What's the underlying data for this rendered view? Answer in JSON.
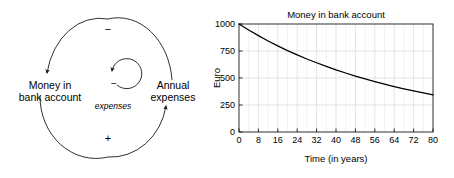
{
  "loop_diagram": {
    "name": "causal-loop-diagram",
    "left_label": "Money in\nbank account",
    "left_label_line1": "Money in",
    "left_label_line2": "bank account",
    "right_label_line1": "Annual",
    "right_label_line2": "expenses",
    "inner_label": "expenses",
    "sign_top": "−",
    "sign_bottom": "+",
    "sign_inner": "−",
    "stroke_color": "#1a1a1a"
  },
  "chart_data": {
    "type": "line",
    "title": "Money in bank account",
    "xlabel": "Time (in years)",
    "ylabel": "Euro",
    "xlim": [
      0,
      80
    ],
    "ylim": [
      0,
      1000
    ],
    "grid": true,
    "legend": "none",
    "xticks": [
      0,
      8,
      16,
      24,
      32,
      40,
      48,
      56,
      64,
      72,
      80
    ],
    "xticklabels": [
      "0",
      "8",
      "16",
      "24",
      "32",
      "40",
      "48",
      "56",
      "64",
      "72",
      "80"
    ],
    "yticks": [
      0,
      250,
      500,
      750,
      1000
    ],
    "yticklabels": [
      "0",
      "250",
      "500",
      "750",
      "1000"
    ],
    "line_color": "#000000",
    "series": [
      {
        "name": "Money in bank account",
        "x": [
          0,
          4,
          8,
          12,
          16,
          20,
          24,
          28,
          32,
          36,
          40,
          44,
          48,
          52,
          56,
          60,
          64,
          68,
          72,
          76,
          80
        ],
        "values": [
          1000,
          944,
          892,
          843,
          797,
          754,
          714,
          676,
          641,
          607,
          576,
          546,
          518,
          492,
          467,
          444,
          421,
          400,
          381,
          362,
          344
        ]
      }
    ]
  }
}
